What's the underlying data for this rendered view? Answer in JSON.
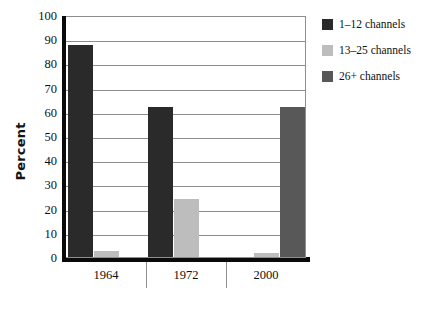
{
  "chart_data": {
    "type": "bar",
    "title": "",
    "subtitle": "",
    "xlabel": "",
    "ylabel": "Percent",
    "categories": [
      "1964",
      "1972",
      "2000"
    ],
    "series": [
      {
        "name": "1–12 channels",
        "color": "#2a2a2a",
        "values": [
          87.5,
          62,
          0
        ]
      },
      {
        "name": "13–25 channels",
        "color": "#bdbdbd",
        "values": [
          2.5,
          24,
          1.5
        ]
      },
      {
        "name": "26+ channels",
        "color": "#585858",
        "values": [
          0,
          0,
          62
        ]
      }
    ],
    "ylim": [
      0,
      100
    ],
    "ytick_step": 10,
    "yticks": [
      "100",
      "90",
      "80",
      "70",
      "60",
      "50",
      "40",
      "30",
      "20",
      "10",
      "0"
    ],
    "grid": true,
    "grid_axis": "y",
    "legend_position": "top-right-outside",
    "annotations": []
  },
  "axes": {
    "y_title": "Percent",
    "spine_color": "#0a0a0a",
    "grid_color": "#8e8e8e",
    "tick_label_color": "#101010"
  },
  "legend": {
    "items": [
      {
        "label": "1–12 channels",
        "color": "#2a2a2a"
      },
      {
        "label": "13–25 channels",
        "color": "#bdbdbd"
      },
      {
        "label": "26+ channels",
        "color": "#585858"
      }
    ]
  },
  "canvas": {
    "background": "#ffffff"
  }
}
